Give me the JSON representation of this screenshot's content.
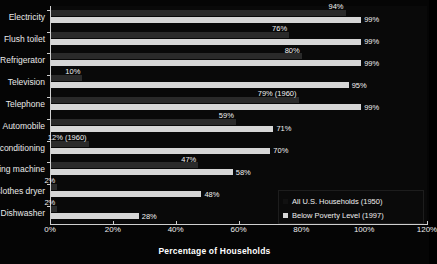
{
  "chart_data": {
    "type": "bar",
    "orientation": "horizontal",
    "title": "",
    "xlabel": "Percentage of Households",
    "ylabel": "",
    "xlim": [
      0,
      120
    ],
    "xticks": [
      "0%",
      "20%",
      "40%",
      "60%",
      "80%",
      "100%",
      "120%"
    ],
    "xtick_values": [
      0,
      20,
      40,
      60,
      80,
      100,
      120
    ],
    "grid": false,
    "legend_position": "bottom-right",
    "categories": [
      "Electricity",
      "Flush toilet",
      "Refrigerator",
      "Television",
      "Telephone",
      "Automobile",
      "r conditioning",
      "hing machine",
      "Clothes dryer",
      "Dishwasher"
    ],
    "series": [
      {
        "name": "All U.S. Households (1950)",
        "color": "#2a2a2a",
        "values": [
          94,
          76,
          80,
          10,
          79,
          59,
          12,
          47,
          2,
          2
        ],
        "labels": [
          "94%",
          "76%",
          "80%",
          "10%",
          "79% (1960)",
          "59%",
          "12% (1960)",
          "47%",
          "2%",
          "2%"
        ]
      },
      {
        "name": "Below Poverty Level (1997)",
        "color": "#d6d6d6",
        "values": [
          99,
          99,
          99,
          95,
          99,
          71,
          70,
          58,
          48,
          28
        ],
        "labels": [
          "99%",
          "99%",
          "99%",
          "95%",
          "99%",
          "71%",
          "70%",
          "58%",
          "48%",
          "28%"
        ]
      }
    ]
  },
  "legend": {
    "entries": [
      {
        "label": "All U.S. Households (1950)"
      },
      {
        "label": "Below Poverty Level (1997)"
      }
    ]
  }
}
